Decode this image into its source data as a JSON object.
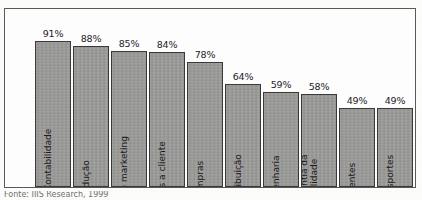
{
  "figure": {
    "frame_border_color": "#5a5a58",
    "background_color": "#ffffff",
    "caption": "Fonte: IIIS Research, 1999"
  },
  "chart_data": {
    "type": "bar",
    "title": "",
    "subtitle": "",
    "xlabel": "",
    "ylabel": "",
    "ylim": [
      0,
      100
    ],
    "grid": false,
    "legend": "none",
    "orientation": "vertical",
    "value_label_suffix": "%",
    "bar_fill_color": "#9b9b99",
    "bar_border_color": "#3b3a38",
    "categories": [
      "Finanças/Contabilidade",
      "Produção",
      "Vendas e marketing",
      "Serviços a cliente",
      "Compras",
      "Distribuição",
      "Engenharia",
      "Garantia da qualidade",
      "Clientes",
      "Transportes"
    ],
    "values": [
      91,
      88,
      85,
      84,
      78,
      64,
      59,
      58,
      49,
      49
    ],
    "value_labels": [
      "91%",
      "88%",
      "85%",
      "84%",
      "78%",
      "64%",
      "59%",
      "58%",
      "49%",
      "49%"
    ]
  }
}
